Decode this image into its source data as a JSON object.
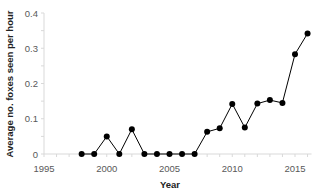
{
  "chart_data": {
    "type": "line",
    "title": "",
    "xlabel": "Year",
    "ylabel": "Average no. foxes seen per hour",
    "xlim": [
      1995,
      2016
    ],
    "ylim": [
      0,
      0.4
    ],
    "x_ticks": [
      1995,
      2000,
      2005,
      2010,
      2015
    ],
    "x_tick_labels": [
      "1995",
      "2000",
      "2005",
      "2010",
      "2015"
    ],
    "y_ticks": [
      0,
      0.1,
      0.2,
      0.3,
      0.4
    ],
    "y_tick_labels": [
      "0",
      "0.1",
      "0.2",
      "0.3",
      "0.4"
    ],
    "grid": false,
    "legend": null,
    "series": [
      {
        "name": "Average no. foxes seen per hour",
        "color": "#000000",
        "marker": "circle",
        "x": [
          1998,
          1999,
          2000,
          2001,
          2002,
          2003,
          2004,
          2005,
          2006,
          2007,
          2008,
          2009,
          2010,
          2011,
          2012,
          2013,
          2014,
          2015,
          2016
        ],
        "values": [
          0,
          0,
          0.05,
          0,
          0.07,
          0,
          0,
          0,
          0,
          0,
          0.063,
          0.073,
          0.142,
          0.075,
          0.143,
          0.153,
          0.145,
          0.283,
          0.342
        ]
      }
    ]
  }
}
